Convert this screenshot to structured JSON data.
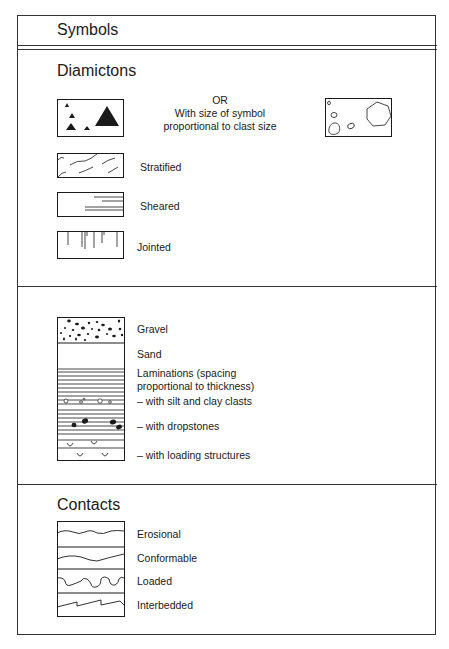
{
  "header": {
    "title": "Symbols"
  },
  "sections": {
    "diamictons": {
      "title": "Diamictons",
      "or_text": "OR",
      "or_desc_line1": "With size of symbol",
      "or_desc_line2": "proportional to clast size",
      "items": [
        {
          "label": "Stratified",
          "symbol": "wavy-dashes"
        },
        {
          "label": "Sheared",
          "symbol": "horizontal-shear-lines"
        },
        {
          "label": "Jointed",
          "symbol": "vertical-joint-lines"
        }
      ],
      "clast_symbols": [
        "filled-triangles",
        "outlined-polygons"
      ]
    },
    "lithology": {
      "items": [
        {
          "label": "Gravel",
          "symbol": "black-dots"
        },
        {
          "label": "Sand",
          "symbol": "blank"
        },
        {
          "label_line1": "Laminations (spacing",
          "label_line2": "proportional to thickness)",
          "symbol": "horizontal-lines"
        },
        {
          "label": "– with silt and clay clasts",
          "symbol": "small-outlined-clasts"
        },
        {
          "label": "– with dropstones",
          "symbol": "black-stones"
        },
        {
          "label": "– with loading structures",
          "symbol": "u-shapes"
        }
      ]
    },
    "contacts": {
      "title": "Contacts",
      "items": [
        {
          "label": "Erosional",
          "symbol": "wavy-line"
        },
        {
          "label": "Conformable",
          "symbol": "gentle-curve"
        },
        {
          "label": "Loaded",
          "symbol": "lobate-line"
        },
        {
          "label": "Interbedded",
          "symbol": "sawtooth-line"
        }
      ]
    }
  },
  "colors": {
    "ink": "#1a1a1a",
    "frame": "#333333",
    "background": "#ffffff"
  }
}
